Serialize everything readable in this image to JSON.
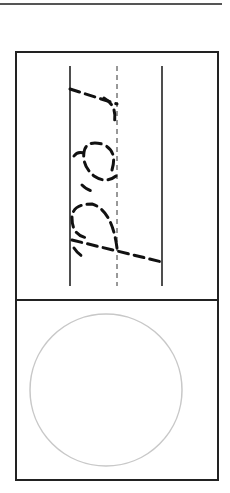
{
  "worksheet": {
    "practice_letters": "rea",
    "orientation": "rotated-90",
    "guide_lines": [
      "baseline-solid",
      "midline-dashed",
      "topline-solid"
    ],
    "trace_style": "dashed",
    "drawing_area": "circle"
  },
  "colors": {
    "ink": "#111111",
    "border": "#222222",
    "circle": "#c8c8c8"
  }
}
